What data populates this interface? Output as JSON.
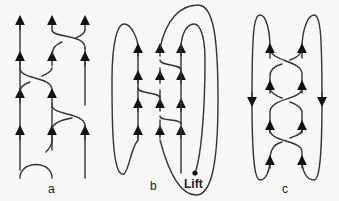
{
  "figure": {
    "panels": [
      {
        "id": "a",
        "label": "a",
        "description": "Three-strand braid with upward arrows"
      },
      {
        "id": "b",
        "label": "b",
        "description": "Braid closure with loops",
        "annotation": "Lift"
      },
      {
        "id": "c",
        "label": "c",
        "description": "Two-strand closure with outer downward loops"
      }
    ],
    "colors": {
      "stroke": "#333333",
      "background": "#f7f7f5"
    }
  }
}
